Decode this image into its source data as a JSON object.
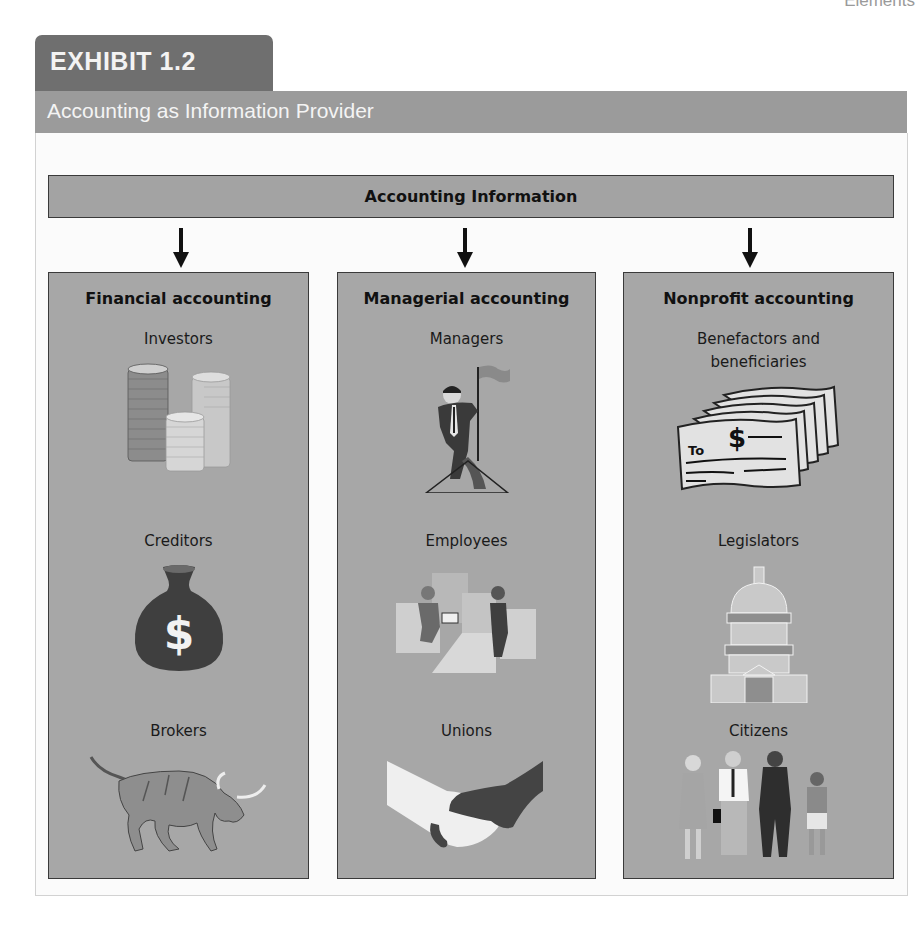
{
  "page": {
    "corner_label": "Elements"
  },
  "exhibit": {
    "label": "EXHIBIT 1.2",
    "title": "Accounting as Information Provider"
  },
  "diagram": {
    "source": "Accounting Information",
    "columns": [
      {
        "title": "Financial accounting",
        "audiences": [
          {
            "label": "Investors",
            "icon": "coin-stacks-icon"
          },
          {
            "label": "Creditors",
            "icon": "money-bag-icon"
          },
          {
            "label": "Brokers",
            "icon": "bull-icon"
          }
        ]
      },
      {
        "title": "Managerial accounting",
        "audiences": [
          {
            "label": "Managers",
            "icon": "manager-with-flag-icon"
          },
          {
            "label": "Employees",
            "icon": "workers-icon"
          },
          {
            "label": "Unions",
            "icon": "handshake-icon"
          }
        ]
      },
      {
        "title": "Nonprofit accounting",
        "audiences": [
          {
            "label": "Benefactors and beneficiaries",
            "label_line1": "Benefactors and",
            "label_line2": "beneficiaries",
            "icon": "checks-icon",
            "check_to": "To",
            "check_symbol": "$"
          },
          {
            "label": "Legislators",
            "icon": "capitol-icon"
          },
          {
            "label": "Citizens",
            "icon": "citizens-icon"
          }
        ]
      }
    ]
  },
  "colors": {
    "exhibit_tab": "#6f6f6f",
    "title_band": "#9b9b9b",
    "info_bar": "#a3a3a3",
    "column_fill": "#a7a7a7",
    "border": "#3a3a3a"
  }
}
